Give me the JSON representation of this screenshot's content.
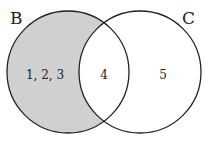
{
  "diagram": {
    "type": "venn",
    "sets": [
      {
        "name": "B",
        "label": "B",
        "shaded": true
      },
      {
        "name": "C",
        "label": "C",
        "shaded": false
      }
    ],
    "regions": {
      "b_only": "1, 2, 3",
      "b_and_c": "4",
      "c_only": "5"
    },
    "shaded_region": "B minus C",
    "colors": {
      "shade": "#d0d0d0",
      "stroke": "#222222",
      "background": "#ffffff"
    }
  }
}
